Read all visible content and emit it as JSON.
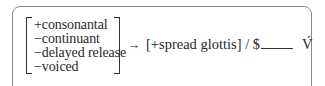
{
  "rule": {
    "features": [
      "+consonantal",
      "−continuant",
      "−delayed release",
      "−voiced"
    ],
    "arrow": "→",
    "output": "[+spread glottis]",
    "slash": "/",
    "boundary": "$",
    "target": "V́"
  }
}
